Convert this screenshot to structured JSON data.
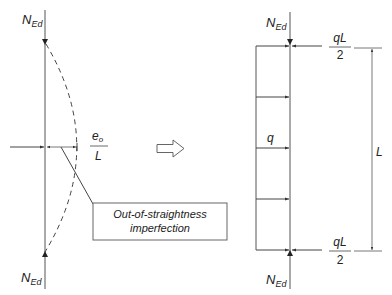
{
  "left_figure": {
    "top_force_label": "N",
    "top_force_sub": "Ed",
    "bottom_force_label": "N",
    "bottom_force_sub": "Ed",
    "eccentricity_numerator": "e",
    "eccentricity_sub": "o",
    "eccentricity_denominator": "L",
    "callout_line1": "Out-of-straightness",
    "callout_line2": "imperfection"
  },
  "transform_arrow": {
    "icon": "hollow-right-arrow-icon"
  },
  "right_figure": {
    "top_force_label": "N",
    "top_force_sub": "Ed",
    "bottom_force_label": "N",
    "bottom_force_sub": "Ed",
    "distributed_load_label": "q",
    "top_reaction_numerator": "qL",
    "top_reaction_denominator": "2",
    "bottom_reaction_numerator": "qL",
    "bottom_reaction_denominator": "2",
    "length_label": "L"
  },
  "colors": {
    "line": "#444444",
    "text": "#222222",
    "background": "#ffffff"
  }
}
